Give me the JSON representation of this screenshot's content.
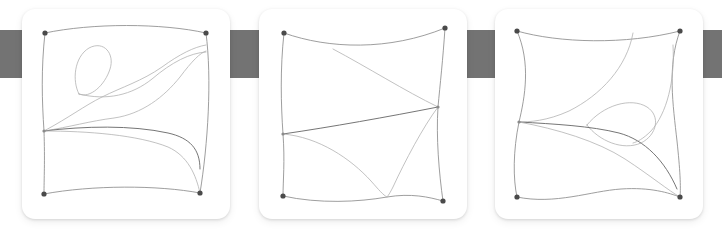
{
  "canvas": {
    "width": 722,
    "height": 232,
    "background_color": "#ffffff"
  },
  "background_bar": {
    "label": "horizontal gray band",
    "color": "#737373",
    "x": 0,
    "y": 30,
    "width": 722,
    "height": 48
  },
  "panels": [
    {
      "id": "panel-1",
      "label": "Curve diagram 1",
      "x": 22,
      "y": 9,
      "width": 208,
      "height": 210,
      "background_color": "#ffffff",
      "corner_radius": 13,
      "vertices": [
        {
          "name": "top-left",
          "x": 23,
          "y": 24
        },
        {
          "name": "top-right",
          "x": 184,
          "y": 24
        },
        {
          "name": "bottom-left",
          "x": 22,
          "y": 185
        },
        {
          "name": "bottom-right",
          "x": 178,
          "y": 184
        }
      ],
      "junctions": [
        {
          "name": "left-mid",
          "x": 22,
          "y": 122
        },
        {
          "name": "loop-base",
          "x": 57,
          "y": 85
        }
      ],
      "feature": "teardrop loop near upper left"
    },
    {
      "id": "panel-2",
      "label": "Curve diagram 2",
      "x": 259,
      "y": 9,
      "width": 208,
      "height": 210,
      "background_color": "#ffffff",
      "corner_radius": 13,
      "vertices": [
        {
          "name": "top-left",
          "x": 25,
          "y": 24
        },
        {
          "name": "top-right",
          "x": 186,
          "y": 19
        },
        {
          "name": "bottom-left",
          "x": 24,
          "y": 187
        },
        {
          "name": "bottom-right",
          "x": 184,
          "y": 192
        }
      ],
      "junctions": [
        {
          "name": "right-mid",
          "x": 179,
          "y": 98
        },
        {
          "name": "left-mid",
          "x": 24,
          "y": 125
        },
        {
          "name": "bottom-cusp",
          "x": 128,
          "y": 188
        }
      ],
      "feature": "two interior curves converging at right-mid junction"
    },
    {
      "id": "panel-3",
      "label": "Curve diagram 3",
      "x": 495,
      "y": 9,
      "width": 208,
      "height": 210,
      "background_color": "#ffffff",
      "corner_radius": 13,
      "vertices": [
        {
          "name": "top-left",
          "x": 22,
          "y": 22
        },
        {
          "name": "top-right",
          "x": 185,
          "y": 22
        },
        {
          "name": "bottom-left",
          "x": 22,
          "y": 188
        },
        {
          "name": "bottom-right",
          "x": 185,
          "y": 188
        }
      ],
      "junctions": [
        {
          "name": "left-mid",
          "x": 24,
          "y": 113
        },
        {
          "name": "top-mid",
          "x": 138,
          "y": 24
        }
      ],
      "feature": "lens shaped loop at center right"
    }
  ]
}
